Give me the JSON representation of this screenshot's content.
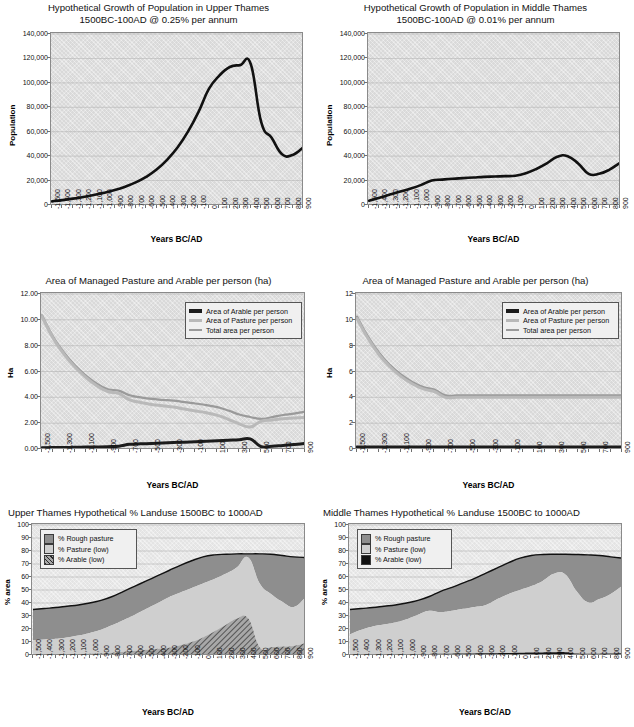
{
  "page": {
    "figure_count": 6,
    "background": "#ffffff"
  },
  "colors": {
    "plot_bg": "#d9d9d9",
    "plot_bg_light": "#e4e4e4",
    "axis": "#6f6f6f",
    "grid": "#b3b3b3",
    "arable_line": "#1c1c1c",
    "pasture_line": "#b9b9b9",
    "total_line": "#9a9a9a",
    "rough_pasture_fill": "#8e8e8e",
    "pasture_fill": "#cfcfcf",
    "arable_fill": "#a8a8a8",
    "population_line": "#111111"
  },
  "charts": [
    {
      "id": "upper-thames-population",
      "title": "Hypothetical Growth of Population in Upper Thames\n1500BC-100AD @ 0.25% per annum",
      "chart_data": {
        "type": "line",
        "title": "Hypothetical Growth of Population in Upper Thames 1500BC-100AD @ 0.25% per annum",
        "xlabel": "Years BC/AD",
        "ylabel": "Population",
        "xlim": [
          -1500,
          900
        ],
        "ylim": [
          0,
          140000
        ],
        "grid": true,
        "legend": "none",
        "yticks": [
          "0",
          "20,000",
          "40,000",
          "60,000",
          "80,000",
          "100,000",
          "120,000",
          "140,000"
        ],
        "ytick_values": [
          0,
          20000,
          40000,
          60000,
          80000,
          100000,
          120000,
          140000
        ],
        "xticks": [
          "-1,500",
          "-1,400",
          "-1,300",
          "-1,200",
          "-1,100",
          "-1,000",
          "-900",
          "-800",
          "-700",
          "-600",
          "-500",
          "-400",
          "-300",
          "-200",
          "-100",
          "0",
          "100",
          "200",
          "300",
          "400",
          "500",
          "600",
          "700",
          "800",
          "900"
        ],
        "x": [
          -1500,
          -1400,
          -1300,
          -1200,
          -1100,
          -1000,
          -900,
          -800,
          -700,
          -600,
          -500,
          -400,
          -300,
          -200,
          -100,
          0,
          100,
          200,
          300,
          400,
          500,
          600,
          700,
          800,
          900
        ],
        "series": [
          {
            "name": "Population",
            "values": [
              3000,
              4000,
              5200,
              6600,
              8200,
              10000,
              12200,
              15000,
              18500,
              23000,
              29000,
              37000,
              47000,
              60000,
              76000,
              95000,
              106000,
              113000,
              114500,
              115500,
              68000,
              55000,
              41500,
              41000,
              47000
            ]
          }
        ]
      }
    },
    {
      "id": "middle-thames-population",
      "title": "Hypothetical Growth of Population in Middle Thames\n1500BC-100AD @ 0.01% per annum",
      "chart_data": {
        "type": "line",
        "title": "Hypothetical Growth of Population in Middle Thames 1500BC-100AD @ 0.01% per annum",
        "xlabel": "Years BC/AD",
        "ylabel": "Population",
        "xlim": [
          -1500,
          900
        ],
        "ylim": [
          0,
          140000
        ],
        "grid": true,
        "legend": "none",
        "yticks": [
          "0",
          "20,000",
          "40,000",
          "60,000",
          "80,000",
          "100,000",
          "120,000",
          "140,000"
        ],
        "ytick_values": [
          0,
          20000,
          40000,
          60000,
          80000,
          100000,
          120000,
          140000
        ],
        "xticks": [
          "-1,500",
          "-1,400",
          "-1,300",
          "-1,200",
          "-1,100",
          "-1,000",
          "-900",
          "-800",
          "-700",
          "-600",
          "-500",
          "-400",
          "-300",
          "-200",
          "-100",
          "0",
          "100",
          "200",
          "300",
          "400",
          "500",
          "600",
          "700",
          "800",
          "900"
        ],
        "x": [
          -1500,
          -1400,
          -1300,
          -1200,
          -1100,
          -1000,
          -900,
          -800,
          -700,
          -600,
          -500,
          -400,
          -300,
          -200,
          -100,
          0,
          100,
          200,
          300,
          400,
          500,
          600,
          700,
          800,
          900
        ],
        "series": [
          {
            "name": "Population",
            "values": [
              3500,
              6000,
              8500,
              11000,
              13500,
              16500,
              20000,
              20800,
              21500,
              22000,
              22500,
              23000,
              23300,
              23600,
              24000,
              26000,
              29500,
              34000,
              39500,
              40000,
              34000,
              25500,
              25500,
              29000,
              34500
            ]
          }
        ]
      }
    },
    {
      "id": "upper-thames-area-per-person",
      "title": "Area of Managed Pasture and Arable per person (ha)",
      "chart_data": {
        "type": "line",
        "title": "Area of Managed Pasture and Arable per person (ha)",
        "xlabel": "Years BC/AD",
        "ylabel": "Ha",
        "xlim": [
          -1500,
          900
        ],
        "ylim": [
          0,
          12
        ],
        "grid": true,
        "legend": "upper right",
        "yticks": [
          "0.00",
          "2.00",
          "4.00",
          "6.00",
          "8.00",
          "10.00",
          "12.00"
        ],
        "ytick_values": [
          0,
          2,
          4,
          6,
          8,
          10,
          12
        ],
        "xticks": [
          "-1,500",
          "-1,300",
          "-1,100",
          "-900",
          "-700",
          "-500",
          "-300",
          "-100",
          "100",
          "300",
          "500",
          "700",
          "900"
        ],
        "x": [
          -1500,
          -1400,
          -1300,
          -1200,
          -1100,
          -1000,
          -900,
          -800,
          -700,
          -600,
          -500,
          -400,
          -300,
          -200,
          -100,
          0,
          100,
          200,
          300,
          400,
          500,
          600,
          700,
          800,
          900
        ],
        "series": [
          {
            "name": "Area of Arable per person",
            "values": [
              0.1,
              0.11,
              0.12,
              0.13,
              0.15,
              0.16,
              0.18,
              0.22,
              0.36,
              0.4,
              0.43,
              0.46,
              0.5,
              0.53,
              0.57,
              0.6,
              0.64,
              0.68,
              0.72,
              0.78,
              0.18,
              0.22,
              0.28,
              0.34,
              0.44
            ]
          },
          {
            "name": "Area of Pasture per person",
            "values": [
              10.25,
              8.6,
              7.35,
              6.35,
              5.55,
              4.9,
              4.45,
              4.3,
              3.8,
              3.6,
              3.45,
              3.35,
              3.25,
              3.1,
              2.95,
              2.8,
              2.6,
              2.3,
              1.95,
              1.7,
              2.15,
              2.25,
              2.35,
              2.4,
              2.45
            ]
          },
          {
            "name": "Total area per person",
            "values": [
              10.35,
              8.71,
              7.47,
              6.48,
              5.7,
              5.06,
              4.63,
              4.52,
              4.16,
              4.0,
              3.88,
              3.81,
              3.75,
              3.63,
              3.52,
              3.4,
              3.24,
              2.98,
              2.67,
              2.48,
              2.33,
              2.47,
              2.63,
              2.74,
              2.89
            ]
          }
        ]
      }
    },
    {
      "id": "middle-thames-area-per-person",
      "title": "Area of Managed Pasture and Arable per person (ha)",
      "chart_data": {
        "type": "line",
        "title": "Area of Managed Pasture and Arable per person (ha)",
        "xlabel": "Years BC/AD",
        "ylabel": "Ha",
        "xlim": [
          -1500,
          900
        ],
        "ylim": [
          0,
          12
        ],
        "grid": true,
        "legend": "upper right",
        "yticks": [
          "0",
          "2",
          "4",
          "6",
          "8",
          "10",
          "12"
        ],
        "ytick_values": [
          0,
          2,
          4,
          6,
          8,
          10,
          12
        ],
        "xticks": [
          "-1,500",
          "-1,300",
          "-1,100",
          "-900",
          "-700",
          "-500",
          "-300",
          "-100",
          "100",
          "300",
          "500",
          "700",
          "900"
        ],
        "x": [
          -1500,
          -1400,
          -1300,
          -1200,
          -1100,
          -1000,
          -900,
          -800,
          -700,
          -600,
          -500,
          -400,
          -300,
          -200,
          -100,
          0,
          100,
          200,
          300,
          400,
          500,
          600,
          700,
          800,
          900
        ],
        "series": [
          {
            "name": "Area of Arable per person",
            "values": [
              0.15,
              0.15,
              0.15,
              0.15,
              0.15,
              0.15,
              0.15,
              0.15,
              0.15,
              0.15,
              0.15,
              0.15,
              0.15,
              0.15,
              0.15,
              0.15,
              0.15,
              0.15,
              0.15,
              0.15,
              0.15,
              0.15,
              0.15,
              0.15,
              0.15
            ]
          },
          {
            "name": "Area of Pasture per person",
            "values": [
              10.1,
              8.55,
              7.3,
              6.35,
              5.6,
              5.05,
              4.65,
              4.45,
              4.0,
              4.0,
              4.0,
              4.0,
              4.0,
              4.0,
              4.0,
              4.0,
              4.0,
              4.0,
              4.0,
              4.0,
              4.0,
              4.0,
              4.0,
              4.0,
              4.0
            ]
          },
          {
            "name": "Total area per person",
            "values": [
              10.25,
              8.7,
              7.45,
              6.5,
              5.75,
              5.2,
              4.8,
              4.6,
              4.15,
              4.15,
              4.15,
              4.15,
              4.15,
              4.15,
              4.15,
              4.15,
              4.15,
              4.15,
              4.15,
              4.15,
              4.15,
              4.15,
              4.15,
              4.15,
              4.15
            ]
          }
        ]
      }
    },
    {
      "id": "upper-thames-landuse",
      "title": "Upper Thames Hypothetical % Landuse 1500BC to 1000AD",
      "chart_data": {
        "type": "area",
        "title": "Upper Thames Hypothetical % Landuse 1500BC to 1000AD",
        "xlabel": "Years BC/AD",
        "ylabel": "% area",
        "xlim": [
          -1500,
          900
        ],
        "ylim": [
          0,
          100
        ],
        "grid": true,
        "legend": "upper left",
        "stacked": true,
        "yticks": [
          "0",
          "10",
          "20",
          "30",
          "40",
          "50",
          "60",
          "70",
          "80",
          "90",
          "100"
        ],
        "ytick_values": [
          0,
          10,
          20,
          30,
          40,
          50,
          60,
          70,
          80,
          90,
          100
        ],
        "xticks": [
          "-1,500",
          "-1,400",
          "-1,300",
          "-1,200",
          "-1,100",
          "-1,000",
          "-900",
          "-800",
          "-700",
          "-600",
          "-500",
          "-400",
          "-300",
          "-200",
          "-100",
          "0",
          "100",
          "200",
          "300",
          "400",
          "500",
          "600",
          "700",
          "800",
          "900"
        ],
        "x": [
          -1500,
          -1400,
          -1300,
          -1200,
          -1100,
          -1000,
          -900,
          -800,
          -700,
          -600,
          -500,
          -400,
          -300,
          -200,
          -100,
          0,
          100,
          200,
          300,
          400,
          500,
          600,
          700,
          800,
          900
        ],
        "series": [
          {
            "name": "% Arable (low)",
            "values": [
              0.3,
              0.4,
              0.5,
              0.6,
              0.8,
              1.0,
              1.3,
              1.8,
              2.5,
              3.2,
              4.0,
              4.8,
              5.6,
              7.5,
              10.0,
              13.5,
              18.0,
              23.0,
              28.0,
              28.0,
              6.0,
              6.0,
              6.5,
              7.0,
              9.0
            ]
          },
          {
            "name": "% Pasture (low)",
            "values": [
              11.5,
              12.0,
              12.5,
              13.5,
              15.0,
              17.0,
              19.5,
              23.0,
              27.0,
              31.0,
              35.5,
              40.0,
              44.5,
              48.0,
              51.5,
              55.0,
              58.5,
              62.5,
              67.5,
              75.0,
              55.0,
              47.0,
              41.0,
              37.0,
              44.0
            ]
          },
          {
            "name": "% Rough pasture",
            "values": [
              35.0,
              35.8,
              36.5,
              37.5,
              38.5,
              40.0,
              42.0,
              45.0,
              49.0,
              53.0,
              57.0,
              61.0,
              65.0,
              69.0,
              72.5,
              75.5,
              77.0,
              77.5,
              77.8,
              77.8,
              77.8,
              77.5,
              76.5,
              75.5,
              75.0
            ]
          }
        ]
      }
    },
    {
      "id": "middle-thames-landuse",
      "title": "Middle Thames Hypothetical % Landuse 1500BC to 1000AD",
      "chart_data": {
        "type": "area",
        "title": "Middle Thames Hypothetical % Landuse 1500BC to 1000AD",
        "xlabel": "Years BC/AD",
        "ylabel": "% area",
        "xlim": [
          -1500,
          900
        ],
        "ylim": [
          0,
          100
        ],
        "grid": true,
        "legend": "upper left",
        "stacked": true,
        "yticks": [
          "0",
          "10",
          "20",
          "30",
          "40",
          "50",
          "60",
          "70",
          "80",
          "90",
          "100"
        ],
        "ytick_values": [
          0,
          10,
          20,
          30,
          40,
          50,
          60,
          70,
          80,
          90,
          100
        ],
        "xticks": [
          "-1,500",
          "-1,400",
          "-1,300",
          "-1,200",
          "-1,100",
          "-1,000",
          "-900",
          "-800",
          "-700",
          "-600",
          "-500",
          "-400",
          "-300",
          "-200",
          "-100",
          "0",
          "100",
          "200",
          "300",
          "400",
          "500",
          "600",
          "700",
          "800",
          "900"
        ],
        "x": [
          -1500,
          -1400,
          -1300,
          -1200,
          -1100,
          -1000,
          -900,
          -800,
          -700,
          -600,
          -500,
          -400,
          -300,
          -200,
          -100,
          0,
          100,
          200,
          300,
          400,
          500,
          600,
          700,
          800,
          900
        ],
        "series": [
          {
            "name": "% Arable (low)",
            "values": [
              0.4,
              0.4,
              0.5,
              0.5,
              0.6,
              0.6,
              0.7,
              0.8,
              0.9,
              1.0,
              1.1,
              1.2,
              1.3,
              1.4,
              1.5,
              1.7,
              1.9,
              2.0,
              2.1,
              2.2,
              1.2,
              1.0,
              1.0,
              1.1,
              1.3
            ]
          },
          {
            "name": "% Pasture (low)",
            "values": [
              16.0,
              19.5,
              22.0,
              23.5,
              25.0,
              27.5,
              31.0,
              34.0,
              33.0,
              34.0,
              35.5,
              37.0,
              38.5,
              43.0,
              47.0,
              50.0,
              53.0,
              57.0,
              62.5,
              62.0,
              49.0,
              40.5,
              43.0,
              47.0,
              53.0
            ]
          },
          {
            "name": "% Rough pasture",
            "values": [
              35.0,
              35.8,
              36.5,
              37.5,
              38.5,
              40.0,
              42.0,
              45.0,
              49.0,
              52.0,
              55.5,
              59.0,
              63.0,
              67.0,
              71.0,
              74.5,
              76.5,
              77.3,
              77.5,
              77.5,
              77.3,
              77.0,
              76.5,
              75.5,
              74.5
            ]
          }
        ]
      }
    }
  ],
  "legends": {
    "area_per_person": [
      {
        "label": "Area of Arable per person",
        "swatch": "line",
        "color": "#1c1c1c",
        "thickness": 4
      },
      {
        "label": "Area of Pasture per person",
        "swatch": "line",
        "color": "#b9b9b9",
        "thickness": 3
      },
      {
        "label": "Total area per person",
        "swatch": "line",
        "color": "#9a9a9a",
        "thickness": 2
      }
    ],
    "landuse": [
      {
        "label": "% Rough pasture",
        "swatch": "box",
        "color": "#8e8e8e"
      },
      {
        "label": "% Pasture (low)",
        "swatch": "box",
        "color": "#cfcfcf"
      },
      {
        "label": "% Arable (low)",
        "swatch": "box-hatch",
        "color": "#a8a8a8"
      }
    ]
  }
}
